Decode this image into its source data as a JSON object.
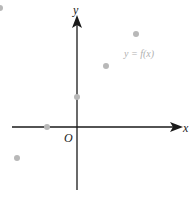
{
  "diagram": {
    "axis_x_label": "x",
    "axis_y_label": "y",
    "origin_label": "O",
    "function_label": "y = f(x)",
    "colors": {
      "axis": "#1a1a1a",
      "point": "#b8b8b8",
      "function_label": "#b0b0b0"
    },
    "points": [
      {
        "cx": 0,
        "cy": 8
      },
      {
        "cx": 136,
        "cy": 34
      },
      {
        "cx": 106,
        "cy": 66
      },
      {
        "cx": 77,
        "cy": 97
      },
      {
        "cx": 47,
        "cy": 127
      },
      {
        "cx": 17,
        "cy": 158
      }
    ]
  }
}
